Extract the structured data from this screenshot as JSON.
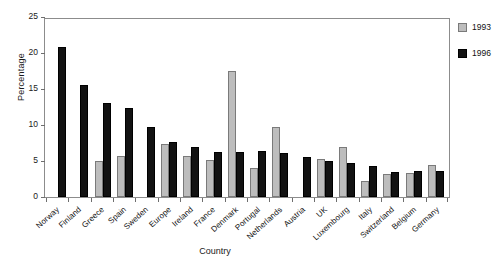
{
  "chart_data": {
    "type": "bar",
    "title": "",
    "xlabel": "Country",
    "ylabel": "Percentage",
    "ylim": [
      0,
      25
    ],
    "yticks": [
      0,
      5,
      10,
      15,
      20,
      25
    ],
    "grid": false,
    "legend_position": "right",
    "categories": [
      "Norway",
      "Finland",
      "Greece",
      "Spain",
      "Sweden",
      "Europe",
      "Ireland",
      "France",
      "Denmark",
      "Portugal",
      "Netherlands",
      "Austria",
      "UK",
      "Luxembourg",
      "Italy",
      "Switzerland",
      "Belgium",
      "Germany"
    ],
    "series": [
      {
        "name": "1993",
        "color": "#bdbdbd",
        "values": [
          null,
          null,
          5.0,
          5.7,
          null,
          7.4,
          5.7,
          5.2,
          17.5,
          4.0,
          9.7,
          null,
          5.3,
          7.0,
          2.2,
          3.2,
          3.4,
          4.5
        ]
      },
      {
        "name": "1996",
        "color": "#121212",
        "values": [
          20.9,
          15.5,
          13.0,
          12.3,
          9.7,
          7.6,
          7.0,
          6.3,
          6.3,
          6.4,
          6.1,
          5.6,
          5.0,
          4.7,
          4.3,
          3.5,
          3.6,
          3.6
        ]
      }
    ]
  },
  "axis": {
    "y_title": "Percentage",
    "x_title": "Country",
    "y_tick_labels": [
      "0",
      "5",
      "10",
      "15",
      "20",
      "25"
    ]
  },
  "legend": {
    "entries": [
      {
        "label": "1993",
        "color": "#bdbdbd"
      },
      {
        "label": "1996",
        "color": "#121212"
      }
    ]
  }
}
